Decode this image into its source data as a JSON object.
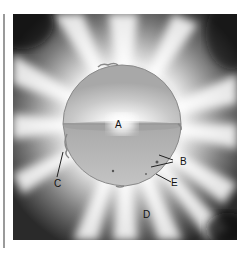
{
  "diagram": {
    "labels": [
      {
        "id": "A",
        "text": "A",
        "points_to": "core"
      },
      {
        "id": "B",
        "text": "B",
        "points_to": "sunspots (two arrows)"
      },
      {
        "id": "C",
        "text": "C",
        "points_to": "prominence at limb"
      },
      {
        "id": "D",
        "text": "D",
        "points_to": "corona"
      },
      {
        "id": "E",
        "text": "E",
        "points_to": "photosphere surface"
      }
    ],
    "colors": {
      "background_dark": "#1e1e1e",
      "corona_light": "#ffffff",
      "sphere_upper": "#c8c8c8",
      "sphere_lower": "#b4b4b4",
      "label_text": "#111111"
    }
  }
}
